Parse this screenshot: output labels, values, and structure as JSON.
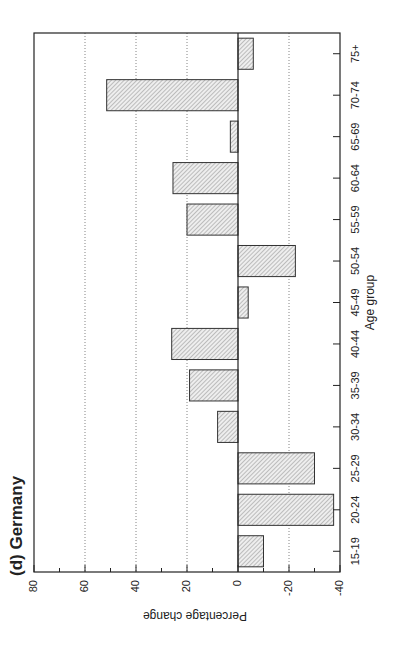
{
  "figure": {
    "panel_title": "(d) Germany",
    "orientation": "rotated-90-ccw"
  },
  "chart_data": {
    "type": "bar",
    "title": "(d) Germany",
    "xlabel": "Age group",
    "ylabel": "Percentage change",
    "categories": [
      "15-19",
      "20-24",
      "25-29",
      "30-34",
      "35-39",
      "40-44",
      "45-49",
      "50-54",
      "55-59",
      "60-64",
      "65-69",
      "70-74",
      "75+"
    ],
    "values": [
      -10,
      -37.5,
      -30,
      8,
      19,
      26,
      -4,
      -22.5,
      20,
      25.5,
      3,
      51.5,
      -6
    ],
    "ylim": [
      -40,
      80
    ],
    "yticks": [
      -40,
      -20,
      0,
      20,
      40,
      60,
      80
    ],
    "ytick_labels": [
      "-40",
      "-20",
      "0",
      "20",
      "40",
      "60",
      "80"
    ],
    "minor_yticks": [
      -30,
      -10,
      10,
      30,
      50,
      70
    ],
    "grid": "dotted horizontal at major ticks",
    "bar_fill": "diagonal hatch",
    "colors": {
      "bar_hatch": "#8a8a8a",
      "bar_bg": "#e6e6e6",
      "bar_edge": "#333333",
      "axis": "#222222",
      "grid": "#666666"
    },
    "legend": null
  }
}
